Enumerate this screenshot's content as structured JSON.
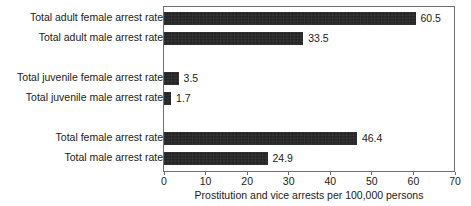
{
  "chart_data": {
    "type": "bar",
    "orientation": "horizontal",
    "title": "",
    "xlabel": "Prostitution and vice arrests per 100,000 persons",
    "ylabel": "",
    "xlim": [
      0,
      70
    ],
    "xticks": [
      0,
      10,
      20,
      30,
      40,
      50,
      60,
      70
    ],
    "xtick_labels": [
      "0",
      "10",
      "20",
      "30",
      "40",
      "50",
      "60",
      "70"
    ],
    "grid": false,
    "legend": null,
    "bar_color": "#1d1d1d",
    "frame_color": "#6e6e6e",
    "categories": [
      "Total adult female arrest rate",
      "Total adult male arrest rate",
      "Total juvenile female arrest rate",
      "Total juvenile male arrest rate",
      "Total female arrest rate",
      "Total male arrest rate"
    ],
    "values": [
      60.5,
      33.5,
      3.5,
      1.7,
      46.4,
      24.9
    ],
    "value_labels": [
      "60.5",
      "33.5",
      "3.5",
      "1.7",
      "46.4",
      "24.9"
    ],
    "bars": [
      {
        "label": "Total adult female arrest rate",
        "value": 60.5,
        "value_label": "60.5",
        "top": 12
      },
      {
        "label": "Total adult male arrest rate",
        "value": 33.5,
        "value_label": "33.5",
        "top": 32
      },
      {
        "label": "Total juvenile female arrest rate",
        "value": 3.5,
        "value_label": "3.5",
        "top": 72
      },
      {
        "label": "Total juvenile male arrest rate",
        "value": 1.7,
        "value_label": "1.7",
        "top": 92
      },
      {
        "label": "Total female arrest rate",
        "value": 46.4,
        "value_label": "46.4",
        "top": 132
      },
      {
        "label": "Total male arrest rate",
        "value": 24.9,
        "value_label": "24.9",
        "top": 152
      }
    ]
  }
}
